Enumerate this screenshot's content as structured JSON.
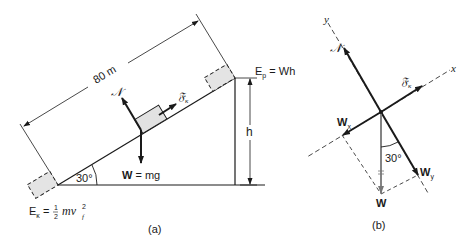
{
  "figure_a": {
    "caption": "(a)",
    "length_label": "80 m",
    "height_label": "h",
    "angle_label": "30°",
    "normal_label": "𝒩",
    "friction_label": "𝔉",
    "friction_sub": "κ",
    "weight_label_bold": "W",
    "weight_label_rest": " = mg",
    "potential_label": "E",
    "potential_sub": "p",
    "potential_rest": " = Wh",
    "kinetic_label": "E",
    "kinetic_sub": "κ",
    "kinetic_eq": " = ",
    "kinetic_frac_num": "1",
    "kinetic_frac_den": "2",
    "kinetic_rest": "mv",
    "kinetic_v_sub": "f",
    "kinetic_v_sup": "2"
  },
  "figure_b": {
    "caption": "(b)",
    "y_axis_label": "y",
    "x_axis_label": "x",
    "normal_label": "𝒩",
    "friction_label": "𝔉",
    "friction_sub": "κ",
    "wx_label": "W",
    "wx_sub": "x",
    "wy_label": "W",
    "wy_sub": "y",
    "w_label": "W",
    "angle_label": "30°"
  },
  "colors": {
    "line": "#1a1a1a",
    "block_fill": "#e2e2e2",
    "weight_gray": "#777777"
  }
}
